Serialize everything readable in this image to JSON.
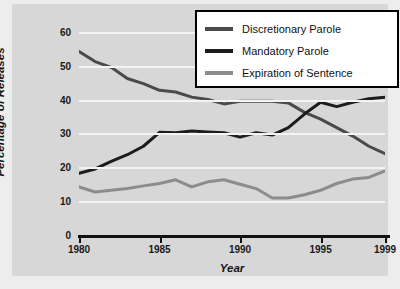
{
  "chart_data": {
    "type": "line",
    "title": "",
    "xlabel": "Year",
    "ylabel": "Percentage of Releases",
    "xlim": [
      1980,
      1999
    ],
    "ylim": [
      0,
      62
    ],
    "grid": true,
    "legend_position": "top-right",
    "xticks": [
      "1980",
      "1985",
      "1990",
      "1995",
      "1999"
    ],
    "xtick_values": [
      1980,
      1985,
      1990,
      1995,
      1999
    ],
    "yticks": [
      "0",
      "10",
      "20",
      "30",
      "40",
      "50",
      "60"
    ],
    "ytick_values": [
      0,
      10,
      20,
      30,
      40,
      50,
      60
    ],
    "x": [
      1980,
      1981,
      1982,
      1983,
      1984,
      1985,
      1986,
      1987,
      1988,
      1989,
      1990,
      1991,
      1992,
      1993,
      1994,
      1995,
      1996,
      1997,
      1998,
      1999
    ],
    "series": [
      {
        "name": "Discretionary Parole",
        "color": "#4a4a4a",
        "values": [
          54.5,
          51.5,
          49.8,
          46.5,
          45.0,
          43.0,
          42.5,
          41.0,
          40.3,
          39.0,
          39.8,
          39.8,
          39.8,
          39.3,
          36.5,
          34.5,
          32.0,
          29.5,
          26.5,
          24.3
        ]
      },
      {
        "name": "Mandatory Parole",
        "color": "#1c1c1c",
        "values": [
          18.5,
          19.8,
          22.0,
          24.0,
          26.5,
          30.6,
          30.5,
          31.0,
          30.7,
          30.5,
          29.2,
          30.5,
          29.8,
          32.0,
          36.0,
          39.5,
          38.2,
          39.5,
          40.5,
          41.0
        ]
      },
      {
        "name": "Expiration of Sentence",
        "color": "#8c8c8c",
        "values": [
          14.5,
          13.0,
          13.5,
          14.0,
          14.8,
          15.5,
          16.6,
          14.5,
          16.0,
          16.6,
          15.3,
          14.0,
          11.2,
          11.2,
          12.2,
          13.5,
          15.5,
          16.8,
          17.3,
          19.2
        ]
      }
    ]
  },
  "legend": {
    "entries": [
      {
        "label": "Discretionary Parole",
        "color": "#4a4a4a"
      },
      {
        "label": "Mandatory Parole",
        "color": "#1c1c1c"
      },
      {
        "label": "Expiration of Sentence",
        "color": "#8c8c8c"
      }
    ]
  }
}
